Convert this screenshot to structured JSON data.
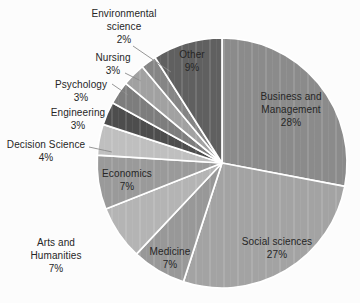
{
  "chart_data": {
    "type": "pie",
    "start": "top",
    "direction": "clockwise",
    "legend": "none",
    "label_style": "small slices labeled outside with leader lines; large slices labeled inside",
    "background_color": "#fcfcfc",
    "slice_border_color": "#ffffff",
    "text_color": "#262626",
    "slices": [
      {
        "name": "Business and Management",
        "pct": "28%",
        "value": 28,
        "color": "#8b8b8b"
      },
      {
        "name": "Social sciences",
        "pct": "27%",
        "value": 27,
        "color": "#a3a3a3"
      },
      {
        "name": "Medicine",
        "pct": "7%",
        "value": 7,
        "color": "#989898"
      },
      {
        "name": "Arts and Humanities",
        "pct": "7%",
        "value": 7,
        "color": "#b4b4b4"
      },
      {
        "name": "Economics",
        "pct": "7%",
        "value": 7,
        "color": "#9a9a9a"
      },
      {
        "name": "Decision Science",
        "pct": "4%",
        "value": 4,
        "color": "#bfbfbf"
      },
      {
        "name": "Engineering",
        "pct": "3%",
        "value": 3,
        "color": "#4d4d4d"
      },
      {
        "name": "Psychology",
        "pct": "3%",
        "value": 3,
        "color": "#7d7d7d"
      },
      {
        "name": "Nursing",
        "pct": "3%",
        "value": 3,
        "color": "#a1a1a1"
      },
      {
        "name": "Environmental science",
        "pct": "2%",
        "value": 2,
        "color": "#858585"
      },
      {
        "name": "Other",
        "pct": "9%",
        "value": 9,
        "color": "#606060"
      }
    ]
  }
}
